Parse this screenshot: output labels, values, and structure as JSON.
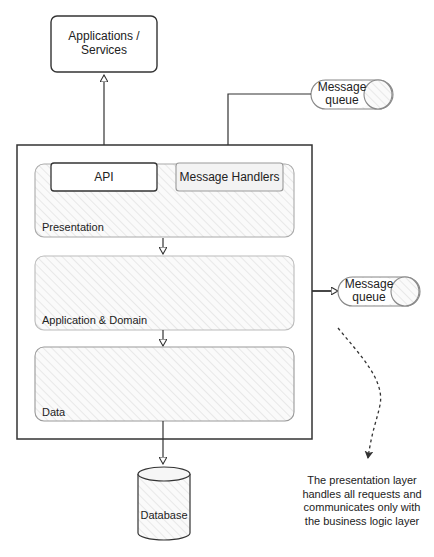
{
  "nodes": {
    "apps": {
      "label_line1": "Applications /",
      "label_line2": "Services"
    },
    "mq_top": {
      "label_line1": "Message",
      "label_line2": "queue"
    },
    "mq_right": {
      "label_line1": "Message",
      "label_line2": "queue"
    },
    "api": {
      "label": "API"
    },
    "message_handlers": {
      "label": "Message Handlers"
    },
    "database": {
      "label": "Database"
    }
  },
  "layers": [
    {
      "name": "Presentation"
    },
    {
      "name": "Application & Domain"
    },
    {
      "name": "Data"
    }
  ],
  "annotation": {
    "line1": "The presentation layer",
    "line2": "handles all requests and",
    "line3": "communicates only with",
    "line4": "the business logic layer"
  },
  "colors": {
    "stroke": "#333333",
    "hatch": "#d8d8d8",
    "fill": "#f7f7f7"
  }
}
